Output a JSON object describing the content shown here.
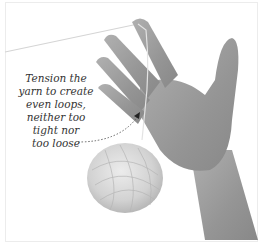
{
  "image": {
    "description": "Hand holding yarn strand over fingers with yarn ball hanging below",
    "callout": {
      "lines": [
        "Tension the",
        "yarn to create",
        "even loops,",
        "neither too",
        "tight nor",
        "too loose"
      ]
    },
    "colors": {
      "skin": "#9a9a9a",
      "skin_shadow": "#7d7d7d",
      "yarn": "#d8d8d8",
      "text": "#333333",
      "background": "#ffffff"
    }
  }
}
